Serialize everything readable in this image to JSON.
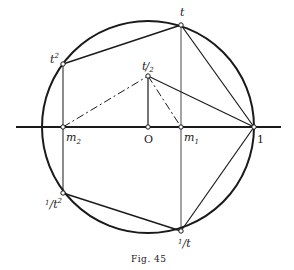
{
  "figure": {
    "caption": "Fig. 45",
    "colors": {
      "ink": "#1a1a1a",
      "background": "#ffffff"
    }
  },
  "labels": {
    "t": "t",
    "t_squared_base": "t",
    "t_squared_exp": "2",
    "t_half_num": "t",
    "t_half_den": "2",
    "origin": "O",
    "one": "1",
    "m1_base": "m",
    "m1_sub": "1",
    "m2_base": "m",
    "m2_sub": "2",
    "inv_t_num": "1",
    "inv_t_den": "t",
    "inv_t2_num": "1",
    "inv_t2_den": "t",
    "inv_t2_exp": "2"
  },
  "points": {
    "O": [
      148,
      127
    ],
    "one": [
      254,
      127
    ],
    "m1": [
      181,
      127
    ],
    "m2": [
      63,
      127
    ],
    "t": [
      181,
      25
    ],
    "t_squared": [
      63,
      64
    ],
    "t_half": [
      148,
      76
    ],
    "inv_t": [
      181,
      231
    ],
    "inv_t_squared": [
      63,
      193
    ]
  },
  "circle": {
    "center": [
      148,
      127
    ],
    "radius": 106
  },
  "axis": {
    "x_start": 16,
    "x_end": 281,
    "y": 127
  }
}
